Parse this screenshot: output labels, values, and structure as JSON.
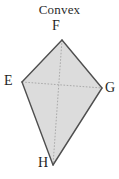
{
  "figure": {
    "title": "Convex",
    "shape_type": "kite-quadrilateral",
    "fill_color": "#dcdcdc",
    "edge_color": "#4f4f4f",
    "diagonal_color": "#a9a9a9",
    "background_color": "#ffffff",
    "vertices": [
      {
        "id": "F",
        "label": "F",
        "x": 62,
        "y": 40,
        "role": "top-apex"
      },
      {
        "id": "E",
        "label": "E",
        "x": 22,
        "y": 82,
        "role": "left"
      },
      {
        "id": "G",
        "label": "G",
        "x": 102,
        "y": 88,
        "role": "right"
      },
      {
        "id": "H",
        "label": "H",
        "x": 53,
        "y": 165,
        "role": "bottom-apex"
      }
    ],
    "edges": [
      {
        "from": "F",
        "to": "G",
        "style": "solid"
      },
      {
        "from": "G",
        "to": "H",
        "style": "solid"
      },
      {
        "from": "H",
        "to": "E",
        "style": "solid"
      },
      {
        "from": "E",
        "to": "F",
        "style": "solid"
      }
    ],
    "diagonals": [
      {
        "from": "E",
        "to": "G",
        "style": "dotted"
      },
      {
        "from": "F",
        "to": "H",
        "style": "dotted"
      }
    ],
    "polygon_points": "62,40 102,88 53,165 22,82"
  }
}
